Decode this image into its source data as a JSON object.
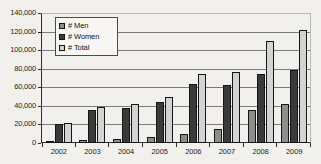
{
  "chart_data": {
    "type": "bar",
    "title": "",
    "xlabel": "",
    "ylabel": "",
    "categories": [
      "2002",
      "2003",
      "2004",
      "2005",
      "2006",
      "2007",
      "2008",
      "2009"
    ],
    "series": [
      {
        "name": "# Men",
        "color": "#8d8d8d",
        "values": [
          1000,
          2800,
          3800,
          6000,
          10000,
          15000,
          35500,
          42000
        ]
      },
      {
        "name": "# Women",
        "color": "#3a3a3a",
        "values": [
          20000,
          36000,
          38000,
          44000,
          63500,
          62000,
          74000,
          79000
        ]
      },
      {
        "name": "# Total",
        "color": "#d3d3d3",
        "values": [
          21500,
          39000,
          42000,
          50000,
          74000,
          77000,
          110000,
          122000
        ]
      }
    ],
    "ylim": [
      0,
      140000
    ],
    "ytick_step": 20000,
    "ytick_labels": [
      "140,000",
      "120,000",
      "100,000",
      "80,000",
      "60,000",
      "40,000",
      "20,000",
      "0"
    ],
    "ytick_values": [
      140000,
      120000,
      100000,
      80000,
      60000,
      40000,
      20000,
      0
    ],
    "grid": true,
    "legend_position": "top-left-inside",
    "legend": [
      "# Men",
      "# Women",
      "# Total"
    ],
    "background_color": "#f2f0ec",
    "axis_color": "#2b2b2b",
    "gridline_color": "#7d7b78"
  }
}
